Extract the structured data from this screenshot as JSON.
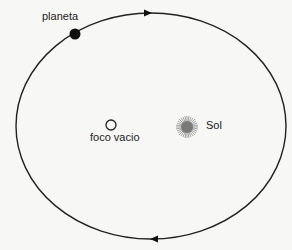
{
  "diagram": {
    "orbit": {
      "cx": 151,
      "cy": 126,
      "rx": 135,
      "ry": 113,
      "stroke": "#222222"
    },
    "planet": {
      "label": "planeta",
      "x": 75,
      "y": 34,
      "r": 5.5,
      "color": "#111111"
    },
    "empty_focus": {
      "label": "foco vacio",
      "x": 111,
      "y": 125,
      "r": 5
    },
    "sun": {
      "label": "Sol",
      "x": 187,
      "y": 127,
      "color": "#888888"
    },
    "arrows": [
      {
        "position": "top",
        "direction": "right",
        "x": 148,
        "y": 13
      },
      {
        "position": "bottom",
        "direction": "left",
        "x": 154,
        "y": 239
      }
    ]
  }
}
